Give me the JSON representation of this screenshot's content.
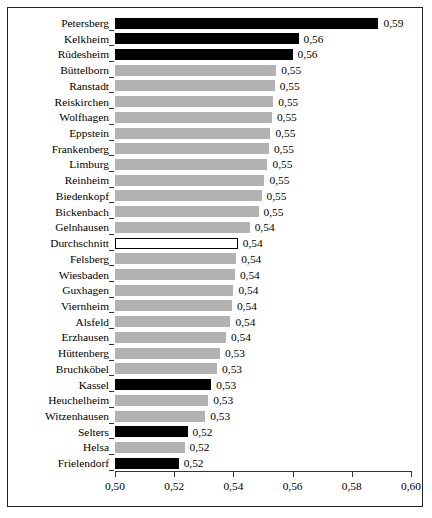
{
  "chart_data": {
    "type": "bar",
    "orientation": "horizontal",
    "title": "",
    "subtitle": "",
    "xlabel": "",
    "ylabel": "",
    "xlim": [
      0.5,
      0.6
    ],
    "grid": false,
    "legend": null,
    "decimal_separator": ",",
    "xtick_labels": [
      "0,50",
      "0,52",
      "0,54",
      "0,56",
      "0,58",
      "0,60"
    ],
    "xtick_values": [
      0.5,
      0.52,
      0.54,
      0.56,
      0.58,
      0.6
    ],
    "categories": [
      "Petersberg",
      "Kelkheim",
      "Rüdesheim",
      "Büttelborn",
      "Ranstadt",
      "Reiskirchen",
      "Wolfhagen",
      "Eppstein",
      "Frankenberg",
      "Limburg",
      "Reinheim",
      "Biedenkopf",
      "Bickenbach",
      "Gelnhausen",
      "Durchschnitt",
      "Felsberg",
      "Wiesbaden",
      "Guxhagen",
      "Viernheim",
      "Alsfeld",
      "Erzhausen",
      "Hüttenberg",
      "Bruchköbel",
      "Kassel",
      "Heuchelheim",
      "Witzenhausen",
      "Selters",
      "Helsa",
      "Frielendorf"
    ],
    "values": [
      0.589,
      0.562,
      0.56,
      0.5545,
      0.554,
      0.5535,
      0.553,
      0.5525,
      0.552,
      0.5515,
      0.5505,
      0.5495,
      0.5485,
      0.5455,
      0.5415,
      0.541,
      0.5405,
      0.54,
      0.5395,
      0.539,
      0.5375,
      0.5355,
      0.5345,
      0.5325,
      0.5315,
      0.5305,
      0.5245,
      0.5235,
      0.5215
    ],
    "value_labels": [
      "0,59",
      "0,56",
      "0,56",
      "0,55",
      "0,55",
      "0,55",
      "0,55",
      "0,55",
      "0,55",
      "0,55",
      "0,55",
      "0,55",
      "0,55",
      "0,54",
      "0,54",
      "0,54",
      "0,54",
      "0,54",
      "0,54",
      "0,54",
      "0,54",
      "0,53",
      "0,53",
      "0,53",
      "0,53",
      "0,53",
      "0,52",
      "0,52",
      "0,52"
    ],
    "bar_styles": [
      "black",
      "black",
      "black",
      "gray",
      "gray",
      "gray",
      "gray",
      "gray",
      "gray",
      "gray",
      "gray",
      "gray",
      "gray",
      "gray",
      "hollow",
      "gray",
      "gray",
      "gray",
      "gray",
      "gray",
      "gray",
      "gray",
      "gray",
      "black",
      "gray",
      "gray",
      "black",
      "gray",
      "black"
    ],
    "colors": {
      "black": "#000000",
      "gray": "#b2b2b2",
      "hollow": "#ffffff",
      "outline": "#000000",
      "axis": "#333333",
      "background": "#ffffff"
    }
  }
}
